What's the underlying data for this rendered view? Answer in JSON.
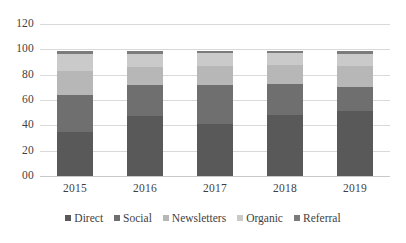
{
  "chart_data": {
    "type": "bar",
    "subtype": "stacked-bar",
    "title": "",
    "subtitle": "",
    "xlabel": "",
    "ylabel": "",
    "categories": [
      "2015",
      "2016",
      "2017",
      "2018",
      "2019"
    ],
    "series": [
      {
        "name": "Direct",
        "color": "#595959",
        "values": [
          35,
          47,
          41,
          48,
          51
        ]
      },
      {
        "name": "Social",
        "color": "#6f6f6f",
        "values": [
          29,
          25,
          31,
          25,
          19
        ]
      },
      {
        "name": "Newsletters",
        "color": "#b7b7b7",
        "values": [
          19,
          14,
          15,
          15,
          17
        ]
      },
      {
        "name": "Organic",
        "color": "#cacaca",
        "values": [
          13,
          10,
          10,
          9,
          9
        ]
      },
      {
        "name": "Referral",
        "color": "#7b7b7b",
        "values": [
          3,
          3,
          2,
          2,
          3
        ]
      }
    ],
    "stack_totals": [
      99,
      99,
      99,
      99,
      99
    ],
    "ylim": [
      0,
      120
    ],
    "ytick_labels": [
      "120",
      "100",
      "80",
      "60",
      "40",
      "20",
      "00"
    ],
    "ytick_values": [
      120,
      100,
      80,
      60,
      40,
      20,
      0
    ],
    "grid": true,
    "grid_axis": "y",
    "legend_position": "bottom",
    "legend_entries": [
      "Direct",
      "Social",
      "Newsletters",
      "Organic",
      "Referral"
    ]
  },
  "axes": {
    "y_ticks": [
      {
        "label": "120",
        "value": 120
      },
      {
        "label": "100",
        "value": 100
      },
      {
        "label": "80",
        "value": 80
      },
      {
        "label": "60",
        "value": 60
      },
      {
        "label": "40",
        "value": 40
      },
      {
        "label": "20",
        "value": 20
      },
      {
        "label": "00",
        "value": 0
      }
    ],
    "x_ticks": [
      {
        "label": "2015"
      },
      {
        "label": "2016"
      },
      {
        "label": "2017"
      },
      {
        "label": "2018"
      },
      {
        "label": "2019"
      }
    ]
  },
  "legend": {
    "items": [
      {
        "label": "Direct",
        "color": "#595959"
      },
      {
        "label": "Social",
        "color": "#6f6f6f"
      },
      {
        "label": "Newsletters",
        "color": "#b7b7b7"
      },
      {
        "label": "Organic",
        "color": "#cacaca"
      },
      {
        "label": "Referral",
        "color": "#7b7b7b"
      }
    ]
  },
  "style": {
    "background": "#ffffff",
    "gridline_color": "#d9d9d9",
    "text_color": "#3f3f3f"
  }
}
